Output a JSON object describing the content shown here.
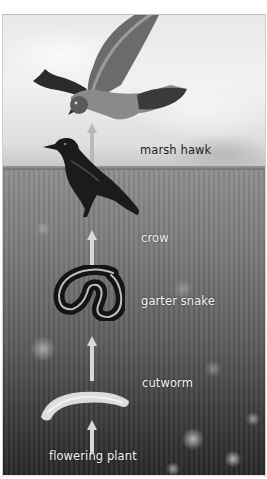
{
  "diagram": {
    "type": "food-chain",
    "direction": "bottom-to-top",
    "arrow_meaning": "energy flows to the eater",
    "background": "grayscale grassland meadow with cloudy sky",
    "organisms": [
      {
        "id": "marsh-hawk",
        "label": "marsh hawk",
        "level": 5
      },
      {
        "id": "crow",
        "label": "crow",
        "level": 4
      },
      {
        "id": "garter-snake",
        "label": "garter snake",
        "level": 3
      },
      {
        "id": "cutworm",
        "label": "cutworm",
        "level": 2
      },
      {
        "id": "flowering-plant",
        "label": "flowering plant",
        "level": 1
      }
    ],
    "links": [
      {
        "from": "flowering plant",
        "to": "cutworm"
      },
      {
        "from": "cutworm",
        "to": "garter snake"
      },
      {
        "from": "garter snake",
        "to": "crow"
      },
      {
        "from": "crow",
        "to": "marsh hawk"
      }
    ]
  },
  "labels": {
    "marsh_hawk": "marsh hawk",
    "crow": "crow",
    "garter_snake": "garter snake",
    "cutworm": "cutworm",
    "flowering_plant": "flowering plant"
  },
  "colors": {
    "arrow": "#c9c9c9",
    "label_on_sky": "#1e1e1e",
    "label_on_field": "#f2f2f2"
  }
}
